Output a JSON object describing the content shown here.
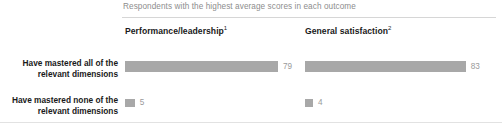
{
  "subtitle": "Respondents with the highest average scores in each outcome",
  "columns": [
    {
      "label": "Performance/leadership",
      "footnote": "1"
    },
    {
      "label": "General satisfaction",
      "footnote": "2"
    }
  ],
  "rows": [
    {
      "label": "Have mastered all of the relevant dimensions"
    },
    {
      "label": "Have mastered none of the relevant dimensions"
    }
  ],
  "values": {
    "r0c0": "79",
    "r0c1": "83",
    "r1c0": "5",
    "r1c1": "4"
  },
  "colors": {
    "bar": "#a8a8a8",
    "value_text": "#9a9a9a",
    "label_text": "#1a1a1a",
    "subtitle_text": "#8d8d8d",
    "rule": "#d6d6d6"
  },
  "chart_data": {
    "type": "bar",
    "title": "",
    "subtitle": "Respondents with the highest average scores in each outcome",
    "orientation": "horizontal",
    "categories": [
      "Have mastered all of the relevant dimensions",
      "Have mastered none of the relevant dimensions"
    ],
    "series": [
      {
        "name": "Performance/leadership",
        "footnote": "1",
        "values": [
          79,
          5
        ]
      },
      {
        "name": "General satisfaction",
        "footnote": "2",
        "values": [
          83,
          4
        ]
      }
    ],
    "value_labels": [
      [
        "79",
        "5"
      ],
      [
        "83",
        "4"
      ]
    ],
    "unit": "%",
    "xlabel": "",
    "ylabel": "",
    "xlim": [
      0,
      100
    ],
    "grid": false,
    "legend": "none",
    "panel_layout": "two-column-small-multiples"
  }
}
